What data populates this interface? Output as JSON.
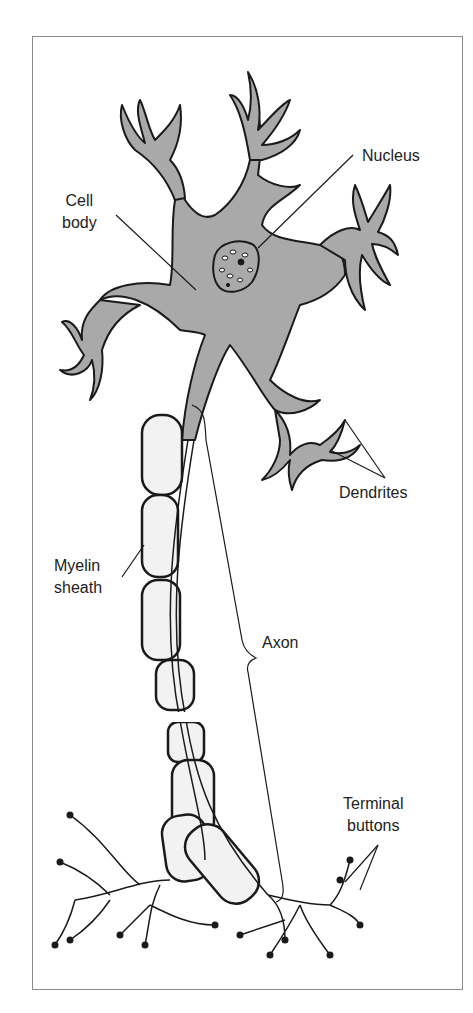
{
  "diagram": {
    "labels": {
      "cell_body": [
        "Cell",
        "body"
      ],
      "nucleus": "Nucleus",
      "dendrites": "Dendrites",
      "myelin_sheath": [
        "Myelin",
        "sheath"
      ],
      "axon": "Axon",
      "terminal_buttons": [
        "Terminal",
        "buttons"
      ]
    },
    "colors": {
      "cell_fill": "#a9a9a9",
      "outline": "#1a1a1a",
      "myelin_fill": "#f2f2f2",
      "frame": "#8a8a8a"
    }
  }
}
